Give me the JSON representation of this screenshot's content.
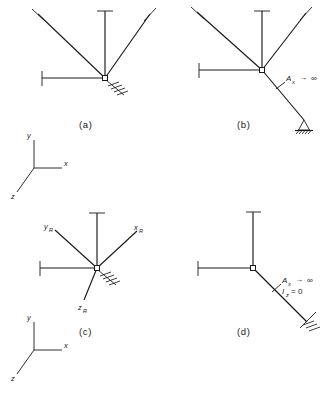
{
  "figure": {
    "type": "engineering-diagram",
    "background_color": "#ffffff",
    "line_color": "#1a1a1a"
  },
  "panels": [
    {
      "id": "a",
      "caption": "(a)",
      "members": 4,
      "support": "fixed-hatch",
      "labels": []
    },
    {
      "id": "b",
      "caption": "(b)",
      "members": 5,
      "support": "pin-triangle-hatch",
      "labels": [
        {
          "name": "Ax-infinity",
          "symbol": "A",
          "subscript": "x",
          "relation": "→",
          "value": "∞"
        }
      ]
    },
    {
      "id": "c",
      "caption": "(c)",
      "members": 4,
      "support": "fixed-hatch",
      "labels": [
        {
          "name": "yR-axis",
          "symbol": "y",
          "subscript": "R"
        },
        {
          "name": "xR-axis",
          "symbol": "x",
          "subscript": "R"
        },
        {
          "name": "zR-axis",
          "symbol": "z",
          "subscript": "R"
        }
      ]
    },
    {
      "id": "d",
      "caption": "(d)",
      "members": 3,
      "support": "fixed-hatch",
      "labels": [
        {
          "name": "Ax-infinity",
          "symbol": "A",
          "subscript": "x",
          "relation": "→",
          "value": "∞"
        },
        {
          "name": "Iz-zero",
          "symbol": "I",
          "subscript": "z",
          "relation": "=",
          "value": "0"
        }
      ]
    }
  ],
  "axis_triads": [
    {
      "name": "upper-triad",
      "axes": [
        {
          "name": "y-axis",
          "label": "y"
        },
        {
          "name": "x-axis",
          "label": "x"
        },
        {
          "name": "z-axis",
          "label": "z"
        }
      ]
    },
    {
      "name": "lower-triad",
      "axes": [
        {
          "name": "y-axis",
          "label": "y"
        },
        {
          "name": "x-axis",
          "label": "x"
        },
        {
          "name": "z-axis",
          "label": "z"
        }
      ]
    }
  ],
  "captions": {
    "a": "(a)",
    "b": "(b)",
    "c": "(c)",
    "d": "(d)"
  },
  "axis_labels": {
    "x": "x",
    "y": "y",
    "z": "z",
    "xR_main": "x",
    "xR_sub": "R",
    "yR_main": "y",
    "yR_sub": "R",
    "zR_main": "z",
    "zR_sub": "R"
  },
  "member_labels": {
    "Ax_main": "A",
    "Ax_sub": "x",
    "Ax_rel": "→",
    "Ax_val": "∞",
    "Iz_main": "I",
    "Iz_sub": "z",
    "Iz_rel": "=",
    "Iz_val": "0"
  }
}
